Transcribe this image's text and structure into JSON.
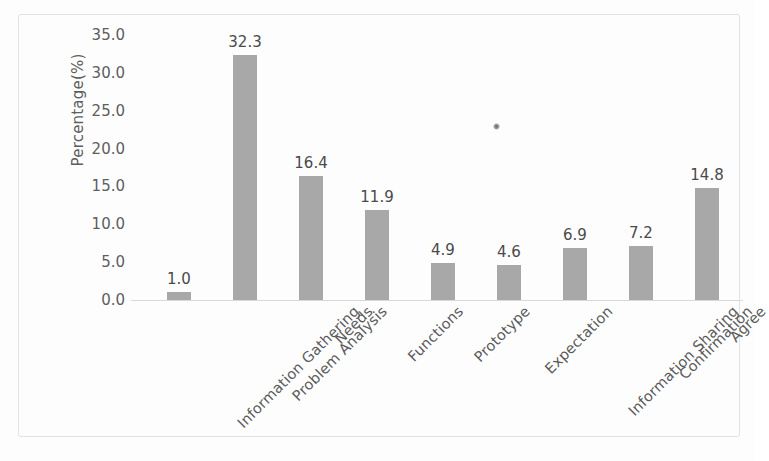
{
  "chart_data": {
    "type": "bar",
    "title": "",
    "subtitle": "",
    "xlabel": "",
    "ylabel": "Percentage(%)",
    "ylim": [
      0.0,
      35.0
    ],
    "ytick_step": 5.0,
    "yticks": [
      "35.0",
      "30.0",
      "25.0",
      "20.0",
      "15.0",
      "10.0",
      "5.0",
      "0.0"
    ],
    "ytick_values": [
      35.0,
      30.0,
      25.0,
      20.0,
      15.0,
      10.0,
      5.0,
      0.0
    ],
    "grid": false,
    "legend": null,
    "legend_position": "none",
    "bar_color": "#a8a8a8",
    "axis_color": "#d9d9d9",
    "border_color": "#e2e2e2",
    "label_color": "#5e5e5e",
    "data_labels_shown": true,
    "categories": [
      "Information Gathering",
      "Problem Analysis",
      "Needs",
      "Functions",
      "Prototype",
      "Expectation",
      "Information Sharing",
      "Confirmation",
      "Agree"
    ],
    "values": [
      1.0,
      32.3,
      16.4,
      11.9,
      4.9,
      4.6,
      6.9,
      7.2,
      14.8
    ],
    "value_labels": [
      "1.0",
      "32.3",
      "16.4",
      "11.9",
      "4.9",
      "4.6",
      "6.9",
      "7.2",
      "14.8"
    ]
  }
}
